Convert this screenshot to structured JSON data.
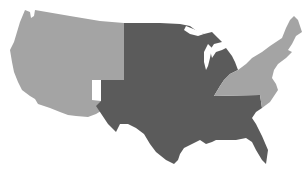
{
  "map": {
    "title": "United States regions",
    "regions": [
      {
        "id": "west",
        "label": "West",
        "color": "#a4a4a4"
      },
      {
        "id": "central",
        "label": "Central",
        "color": "#5b5b5b"
      },
      {
        "id": "east",
        "label": "East",
        "color": "#a4a4a4"
      }
    ],
    "background": "#ffffff"
  }
}
